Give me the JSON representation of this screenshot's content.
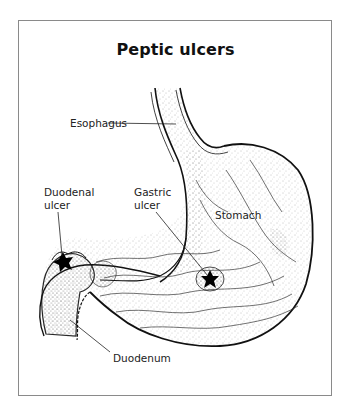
{
  "figure": {
    "title": "Peptic ulcers",
    "labels": {
      "esophagus": "Esophagus",
      "duodenal_ulcer_line1": "Duodenal",
      "duodenal_ulcer_line2": "ulcer",
      "gastric_ulcer_line1": "Gastric",
      "gastric_ulcer_line2": "ulcer",
      "stomach": "Stomach",
      "duodenum": "Duodenum"
    },
    "colors": {
      "outline": "#111111",
      "frame": "#8a8a8a",
      "stipple": "#555555",
      "ulcer": "#000000",
      "background": "#ffffff"
    }
  }
}
